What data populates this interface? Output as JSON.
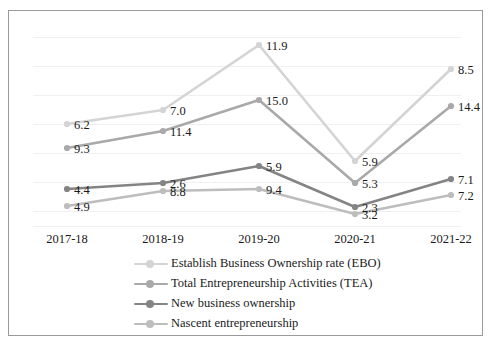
{
  "chart_data": {
    "type": "line",
    "title": "",
    "subtitle": "",
    "xlabel": "",
    "ylabel": "",
    "grid": true,
    "legend_position": "bottom",
    "categories": [
      "2017-18",
      "2018-19",
      "2019-20",
      "2020-21",
      "2021-22"
    ],
    "series": [
      {
        "name": "Establish Business Ownership rate (EBO)",
        "color": "#d4d4d4",
        "values": [
          6.2,
          7.0,
          11.9,
          5.9,
          8.5
        ],
        "labels": [
          "6.2",
          "7.0",
          "11.9",
          "5.9",
          "8.5"
        ],
        "points_px": [
          {
            "x": 58,
            "y": 113
          },
          {
            "x": 154,
            "y": 99
          },
          {
            "x": 250,
            "y": 34
          },
          {
            "x": 346,
            "y": 150
          },
          {
            "x": 442,
            "y": 58
          }
        ]
      },
      {
        "name": "Total Entrepreneurship Activities (TEA)",
        "color": "#a9a9a9",
        "values": [
          9.3,
          11.4,
          15.0,
          5.3,
          14.4
        ],
        "labels": [
          "9.3",
          "11.4",
          "15.0",
          "5.3",
          "14.4"
        ],
        "points_px": [
          {
            "x": 58,
            "y": 137
          },
          {
            "x": 154,
            "y": 120
          },
          {
            "x": 250,
            "y": 89
          },
          {
            "x": 346,
            "y": 172
          },
          {
            "x": 442,
            "y": 95
          }
        ]
      },
      {
        "name": "New business ownership",
        "color": "#848484",
        "values": [
          4.4,
          2.6,
          5.9,
          2.3,
          7.1
        ],
        "labels": [
          "4.4",
          "2.6",
          "5.9",
          "2.3",
          "7.1"
        ],
        "points_px": [
          {
            "x": 58,
            "y": 178
          },
          {
            "x": 154,
            "y": 172
          },
          {
            "x": 250,
            "y": 155
          },
          {
            "x": 346,
            "y": 196
          },
          {
            "x": 442,
            "y": 168
          }
        ]
      },
      {
        "name": "Nascent entrepreneurship",
        "color": "#bdbdbd",
        "values": [
          4.9,
          8.8,
          9.4,
          3.2,
          7.2
        ],
        "labels": [
          "4.9",
          "8.8",
          "9.4",
          "3.2",
          "7.2"
        ],
        "points_px": [
          {
            "x": 58,
            "y": 195
          },
          {
            "x": 154,
            "y": 180
          },
          {
            "x": 250,
            "y": 178
          },
          {
            "x": 346,
            "y": 203
          },
          {
            "x": 442,
            "y": 184
          }
        ]
      }
    ],
    "gridlines_y_px": [
      26,
      55,
      84,
      113,
      142,
      171,
      200,
      215
    ],
    "axis_x_px": [
      58,
      154,
      250,
      346,
      442
    ],
    "xtick_y_px": 222
  },
  "legend": {
    "items": [
      {
        "label": "Establish Business Ownership rate (EBO)",
        "color": "#d4d4d4"
      },
      {
        "label": "Total Entrepreneurship Activities (TEA)",
        "color": "#a9a9a9"
      },
      {
        "label": "New business ownership",
        "color": "#848484"
      },
      {
        "label": "Nascent entrepreneurship",
        "color": "#bdbdbd"
      }
    ]
  },
  "xaxis": {
    "ticks": [
      "2017-18",
      "2018-19",
      "2019-20",
      "2020-21",
      "2021-22"
    ]
  }
}
